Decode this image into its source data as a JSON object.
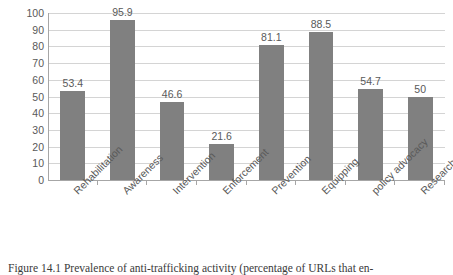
{
  "chart_data": {
    "type": "bar",
    "title": "",
    "xlabel": "",
    "ylabel": "",
    "ylim": [
      0,
      100
    ],
    "ytick_step": 10,
    "grid": true,
    "legend": false,
    "bar_color": "#808080",
    "label_color": "#595959",
    "gridline_color": "#d4d4d4",
    "axis_color": "#a6a6a6",
    "categories": [
      "Rehabilitation",
      "Awareness",
      "Intervention",
      "Enforcement",
      "Prevention",
      "Equipping",
      "policy advocacy",
      "Research"
    ],
    "values": [
      53.4,
      95.9,
      46.6,
      21.6,
      81.1,
      88.5,
      54.7,
      50
    ],
    "value_labels": [
      "53.4",
      "95.9",
      "46.6",
      "21.6",
      "81.1",
      "88.5",
      "54.7",
      "50"
    ],
    "yticks": [
      100,
      90,
      80,
      70,
      60,
      50,
      40,
      30,
      20,
      10,
      0
    ],
    "ytick_labels": [
      "100",
      "90",
      "80",
      "70",
      "60",
      "50",
      "40",
      "30",
      "20",
      "10",
      "0"
    ]
  },
  "caption": {
    "text": "Figure 14.1 Prevalence of anti-trafficking activity (percentage of URLs that en-"
  }
}
